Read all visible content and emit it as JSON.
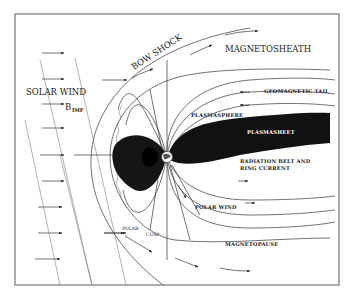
{
  "diagram": {
    "labels": {
      "solar_wind": "SOLAR WIND",
      "b_imf_main": "B",
      "b_imf_sub": "IMF",
      "bow_shock": "BOW SHOCK",
      "magnetosheath": "MAGNETOSHEATH",
      "geomagnetic_tail": "GEOMAGNETIC TAIL",
      "plasmasphere": "PLASMASPHERE",
      "plasmasheet": "PLASMASHEET",
      "radiation_belt_line1": "RADIATION BELT AND",
      "radiation_belt_line2": "RING CURRENT",
      "polar_wind": "POLAR WIND",
      "magnetopause": "MAGNETOPAUSE",
      "polar": "POLAR",
      "cusp": "CUSP"
    },
    "colors": {
      "background": "#ffffff",
      "ink": "#1a1a1a",
      "plasma": "#111111",
      "frame": "#777777"
    }
  }
}
